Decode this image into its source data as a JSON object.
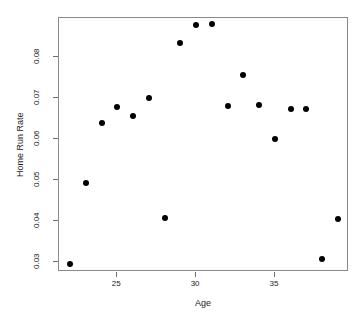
{
  "chart_data": {
    "type": "scatter",
    "title": "",
    "xlabel": "Age",
    "ylabel": "Home Run Rate",
    "xlim": [
      21.3,
      39.7
    ],
    "ylim": [
      0.0276,
      0.0894
    ],
    "grid": false,
    "legend": null,
    "xticks": [
      25,
      30,
      35
    ],
    "xtick_labels": [
      "25",
      "30",
      "35"
    ],
    "yticks": [
      0.03,
      0.04,
      0.05,
      0.06,
      0.07,
      0.08
    ],
    "ytick_labels": [
      "0.03",
      "0.04",
      "0.05",
      "0.06",
      "0.07",
      "0.08"
    ],
    "marker": "filled-circle",
    "marker_color": "#000000",
    "x": [
      22,
      23,
      24,
      25,
      26,
      27,
      28,
      29,
      30,
      31,
      32,
      33,
      34,
      35,
      36,
      37,
      38,
      39
    ],
    "y": [
      0.0295,
      0.0493,
      0.0638,
      0.0678,
      0.0655,
      0.07,
      0.0407,
      0.0832,
      0.0877,
      0.088,
      0.068,
      0.0755,
      0.0682,
      0.06,
      0.0672,
      0.0672,
      0.0307,
      0.0405
    ],
    "points": [
      {
        "x": 22,
        "y": 0.0295
      },
      {
        "x": 23,
        "y": 0.0493
      },
      {
        "x": 24,
        "y": 0.0638
      },
      {
        "x": 25,
        "y": 0.0678
      },
      {
        "x": 26,
        "y": 0.0655
      },
      {
        "x": 27,
        "y": 0.07
      },
      {
        "x": 28,
        "y": 0.0407
      },
      {
        "x": 29,
        "y": 0.0832
      },
      {
        "x": 30,
        "y": 0.0877
      },
      {
        "x": 31,
        "y": 0.088
      },
      {
        "x": 32,
        "y": 0.068
      },
      {
        "x": 33,
        "y": 0.0755
      },
      {
        "x": 34,
        "y": 0.0682
      },
      {
        "x": 35,
        "y": 0.06
      },
      {
        "x": 36,
        "y": 0.0672
      },
      {
        "x": 37,
        "y": 0.0672
      },
      {
        "x": 38,
        "y": 0.0307
      },
      {
        "x": 39,
        "y": 0.0405
      }
    ]
  },
  "axis": {
    "x_title": "Age",
    "y_title": "Home Run Rate"
  },
  "colors": {
    "marker": "#000000",
    "axis": "#8a8a8a",
    "text": "#1a1a1a",
    "background": "#ffffff"
  }
}
